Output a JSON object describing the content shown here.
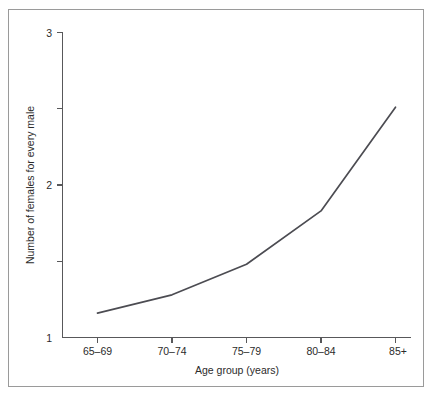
{
  "chart_data": {
    "type": "line",
    "title": "",
    "subtitle": "",
    "xlabel": "Age group (years)",
    "ylabel": "Number of females for every male",
    "categories": [
      "65–69",
      "70–74",
      "75–79",
      "80–84",
      "85+"
    ],
    "values": [
      1.16,
      1.28,
      1.48,
      1.83,
      2.51
    ],
    "series": [
      {
        "name": "Females per male",
        "values": [
          1.16,
          1.28,
          1.48,
          1.83,
          2.51
        ]
      }
    ],
    "ylim": [
      1,
      3
    ],
    "y_major_ticks": [
      1,
      2,
      3
    ],
    "y_major_tick_labels": [
      "1",
      "2",
      "3"
    ],
    "y_minor_ticks": [
      1.5,
      2.5
    ],
    "x_tick_labels": [
      "65–69",
      "70–74",
      "75–79",
      "80–84",
      "85+"
    ],
    "grid": false,
    "legend": false,
    "legend_position": "none",
    "annotations": [],
    "line_color": "#4c4c52",
    "axis_color": "#58585a",
    "background_color": "#ffffff",
    "border_color": "#9a9a9a"
  },
  "axis": {
    "y_labels": [
      "3",
      "2",
      "1"
    ],
    "x_labels": [
      "65–69",
      "70–74",
      "75–79",
      "80–84",
      "85+"
    ],
    "x_title": "Age group (years)",
    "y_title": "Number of females for every male"
  }
}
